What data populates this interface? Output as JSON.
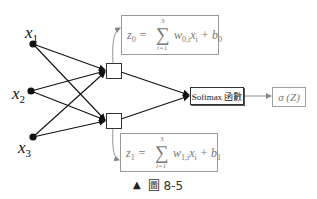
{
  "inputs": [
    {
      "label": "x",
      "sub": "1"
    },
    {
      "label": "x",
      "sub": "2"
    },
    {
      "label": "x",
      "sub": "3"
    }
  ],
  "equations": {
    "top": {
      "lhs": "z",
      "lhs_sub": "0",
      "sum_upper": "3",
      "sum_lower": "i=1",
      "term_w": "w",
      "term_w_sub": "0,i",
      "term_x": "x",
      "term_x_sub": "i",
      "plus": "+",
      "b": "b",
      "b_sub": "0"
    },
    "bottom": {
      "lhs": "z",
      "lhs_sub": "1",
      "sum_upper": "3",
      "sum_lower": "i=1",
      "term_w": "w",
      "term_w_sub": "1,i",
      "term_x": "x",
      "term_x_sub": "i",
      "plus": "+",
      "b": "b",
      "b_sub": "1"
    }
  },
  "softmax": {
    "label": "Softmax 函數"
  },
  "output": {
    "label": "σ (Z)"
  },
  "caption": {
    "marker": "▲",
    "text": "圖 8-5"
  },
  "colors": {
    "lines": "#111111",
    "box_border": "#9a9a9a",
    "gray_text": "#777777"
  }
}
